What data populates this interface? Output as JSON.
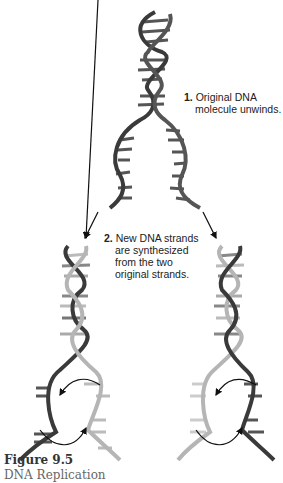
{
  "figure": {
    "number": "Figure 9.5",
    "title": "DNA Replication"
  },
  "steps": [
    {
      "number": "1.",
      "lines": [
        "Original DNA",
        "molecule unwinds."
      ]
    },
    {
      "number": "2.",
      "lines": [
        "New DNA strands",
        "are synthesized",
        "from the two",
        "original strands."
      ]
    }
  ],
  "colors": {
    "original_strand": "#3a3a3a",
    "new_strand": "#b5b5b5",
    "arrow": "#111111",
    "background": "#ffffff"
  }
}
